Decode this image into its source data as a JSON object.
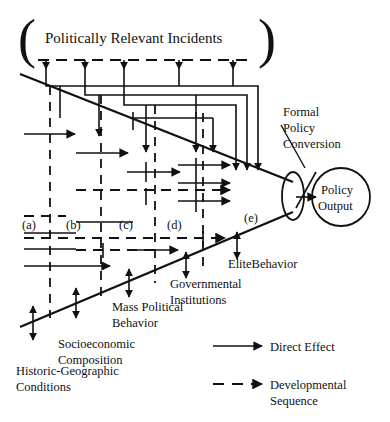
{
  "diagram": {
    "title": "Politically Relevant Incidents",
    "output_node": {
      "line1": "Policy",
      "line2": "Output"
    },
    "conversion_label": {
      "line1": "Formal",
      "line2": "Policy",
      "line3": "Conversion"
    },
    "stage_markers": [
      {
        "id": "a",
        "label": "(a)"
      },
      {
        "id": "b",
        "label": "(b)"
      },
      {
        "id": "c",
        "label": "(c)"
      },
      {
        "id": "d",
        "label": "(d)"
      },
      {
        "id": "e",
        "label": "(e)"
      }
    ],
    "node_labels": [
      {
        "id": "historic-geographic",
        "line1": "Historic-Geographic",
        "line2": "Conditions"
      },
      {
        "id": "socioeconomic",
        "line1": "Socioeconomic",
        "line2": "Composition"
      },
      {
        "id": "mass-political-behavior",
        "line1": "Mass Political",
        "line2": "Behavior"
      },
      {
        "id": "governmental-institutions",
        "line1": "Governmental",
        "line2": "Institutions"
      },
      {
        "id": "elite-behavior",
        "line1": "EliteBehavior",
        "line2": ""
      }
    ],
    "legend": [
      {
        "id": "direct-effect",
        "label": "Direct Effect",
        "style": "solid"
      },
      {
        "id": "developmental-sequence",
        "label": "Developmental",
        "label2": "Sequence",
        "style": "dashed"
      }
    ],
    "colors": {
      "ink": "#111111",
      "background": "#ffffff"
    }
  }
}
